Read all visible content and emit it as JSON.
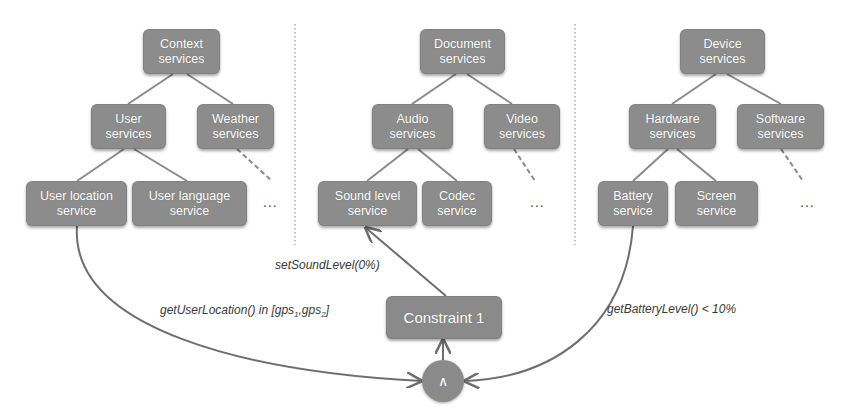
{
  "colors": {
    "node_fill": "#8c8c8c",
    "node_text": "#ffffff",
    "edge": "#7a7a7a",
    "separator": "#b0b0b0",
    "label_text": "#3a3a3a"
  },
  "groups": [
    {
      "root": "Context\nservices",
      "children": [
        "User\nservices",
        "Weather\nservices"
      ],
      "leaves": [
        "User location\nservice",
        "User language\nservice"
      ],
      "ellipsis": "..."
    },
    {
      "root": "Document\nservices",
      "children": [
        "Audio\nservices",
        "Video\nservices"
      ],
      "leaves": [
        "Sound level\nservice",
        "Codec\nservice"
      ],
      "ellipsis": "..."
    },
    {
      "root": "Device\nservices",
      "children": [
        "Hardware\nservices",
        "Software\nservices"
      ],
      "leaves": [
        "Battery\nservice",
        "Screen\nservice"
      ],
      "ellipsis": "..."
    }
  ],
  "constraint": {
    "label": "Constraint 1",
    "operator": "∧"
  },
  "edges": {
    "set_sound_level": "setSoundLevel(0%)",
    "get_user_location_prefix": "getUserLocation() in [gps",
    "get_user_location_sub1": "1",
    "get_user_location_mid": ",gps",
    "get_user_location_sub2": "2",
    "get_user_location_suffix": "]",
    "get_battery_level": "getBatteryLevel() < 10%"
  }
}
